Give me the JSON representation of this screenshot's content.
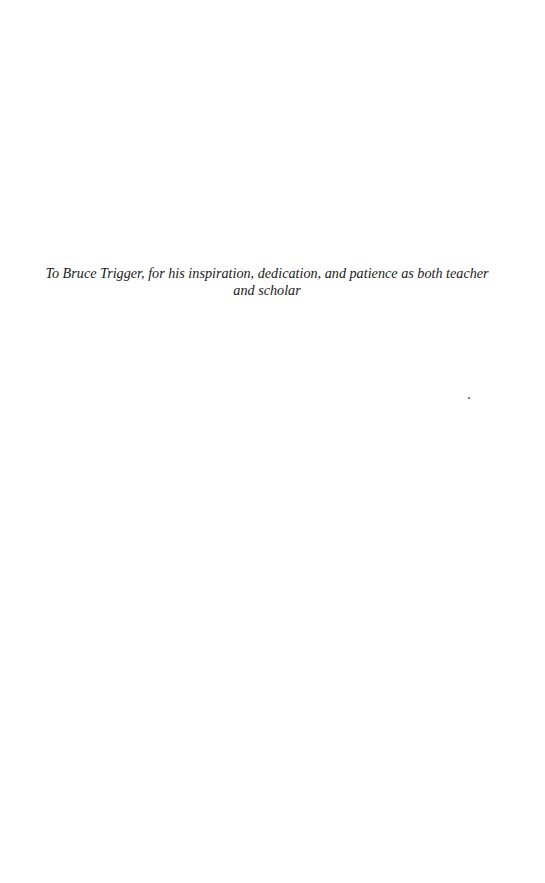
{
  "page": {
    "dedication": "To Bruce Trigger, for his inspiration, dedication, and patience as both teacher and scholar"
  }
}
